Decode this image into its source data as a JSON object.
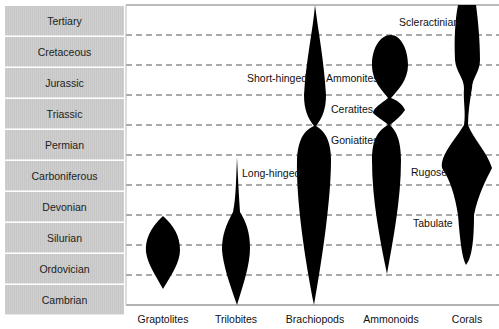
{
  "periods": [
    "Tertiary",
    "Cretaceous",
    "Jurassic",
    "Triassic",
    "Permian",
    "Carboniferous",
    "Devonian",
    "Silurian",
    "Ordovician",
    "Cambrian"
  ],
  "groups": [
    "Graptolites",
    "Trilobites",
    "Brachiopods",
    "Ammonoids",
    "Corals"
  ],
  "subgroup_labels": {
    "long_hinged": "Long-hinged",
    "short_hinged": "Short-hinged",
    "ammonites": "Ammonites",
    "ceratites": "Ceratites",
    "goniatites": "Goniatites",
    "scleractinian": "Scleractinian",
    "rugose": "Rugose",
    "tabulate": "Tabulate"
  },
  "colors": {
    "shape": "#000000",
    "period_bg": "#c9c9c9",
    "grid": "#555555"
  }
}
